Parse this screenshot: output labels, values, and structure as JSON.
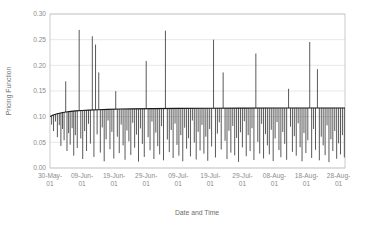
{
  "chart_data": {
    "type": "line",
    "title": "",
    "xlabel": "Date and Time",
    "ylabel": "Pricing Function",
    "ylim": [
      0.0,
      0.3
    ],
    "ytick_labels": [
      "0.00",
      "0.05",
      "0.10",
      "0.15",
      "0.20",
      "0.25",
      "0.30"
    ],
    "ytick_values": [
      0.0,
      0.05,
      0.1,
      0.15,
      0.2,
      0.25,
      0.3
    ],
    "xtick_labels": [
      "30-May-01",
      "09-Jun-01",
      "19-Jun-01",
      "29-Jun-01",
      "09-Jul-01",
      "19-Jul-01",
      "29-Jul-01",
      "08-Aug-01",
      "18-Aug-01",
      "28-Aug-01"
    ],
    "xtick_values": [
      0,
      10,
      20,
      30,
      40,
      50,
      60,
      70,
      80,
      90
    ],
    "xlim": [
      0,
      92
    ],
    "grid": true,
    "grid_axis": "y",
    "legend": false,
    "series_color": "#3b3b3b",
    "baseline_color": "#1a1a1a",
    "baseline_note": "Dense envelope curve rising from about 0.100 and flattening near 0.116",
    "baseline": [
      {
        "x": 0.0,
        "y": 0.1005
      },
      {
        "x": 1.0,
        "y": 0.1032
      },
      {
        "x": 2.0,
        "y": 0.1052
      },
      {
        "x": 3.0,
        "y": 0.1068
      },
      {
        "x": 4.0,
        "y": 0.1081
      },
      {
        "x": 5.0,
        "y": 0.1091
      },
      {
        "x": 6.5,
        "y": 0.1103
      },
      {
        "x": 8.0,
        "y": 0.1112
      },
      {
        "x": 10.0,
        "y": 0.1121
      },
      {
        "x": 12.0,
        "y": 0.1128
      },
      {
        "x": 15.0,
        "y": 0.1136
      },
      {
        "x": 18.0,
        "y": 0.1142
      },
      {
        "x": 22.0,
        "y": 0.1148
      },
      {
        "x": 26.0,
        "y": 0.1152
      },
      {
        "x": 32.0,
        "y": 0.1157
      },
      {
        "x": 40.0,
        "y": 0.1161
      },
      {
        "x": 50.0,
        "y": 0.1164
      },
      {
        "x": 60.0,
        "y": 0.1166
      },
      {
        "x": 70.0,
        "y": 0.1168
      },
      {
        "x": 80.0,
        "y": 0.1169
      },
      {
        "x": 92.0,
        "y": 0.117
      }
    ],
    "spikes": [
      {
        "x": 0.5,
        "top": 0.101,
        "bottom": 0.0845
      },
      {
        "x": 1.1,
        "top": 0.1035,
        "bottom": 0.072
      },
      {
        "x": 1.7,
        "top": 0.105,
        "bottom": 0.0905
      },
      {
        "x": 2.3,
        "top": 0.106,
        "bottom": 0.06
      },
      {
        "x": 2.9,
        "top": 0.107,
        "bottom": 0.0835
      },
      {
        "x": 3.4,
        "top": 0.1075,
        "bottom": 0.043
      },
      {
        "x": 3.9,
        "top": 0.108,
        "bottom": 0.076
      },
      {
        "x": 4.4,
        "top": 0.1085,
        "bottom": 0.054
      },
      {
        "x": 4.9,
        "top": 0.1688,
        "bottom": 0.109
      },
      {
        "x": 5.3,
        "top": 0.1092,
        "bottom": 0.033
      },
      {
        "x": 5.8,
        "top": 0.1097,
        "bottom": 0.068
      },
      {
        "x": 6.3,
        "top": 0.11,
        "bottom": 0.0455
      },
      {
        "x": 6.9,
        "top": 0.1104,
        "bottom": 0.0775
      },
      {
        "x": 7.4,
        "top": 0.1107,
        "bottom": 0.024
      },
      {
        "x": 7.9,
        "top": 0.111,
        "bottom": 0.064
      },
      {
        "x": 8.5,
        "top": 0.1113,
        "bottom": 0.039
      },
      {
        "x": 9.1,
        "top": 0.269,
        "bottom": 0.1115
      },
      {
        "x": 9.6,
        "top": 0.1117,
        "bottom": 0.0575
      },
      {
        "x": 10.2,
        "top": 0.112,
        "bottom": 0.0175
      },
      {
        "x": 10.8,
        "top": 0.1122,
        "bottom": 0.072
      },
      {
        "x": 11.4,
        "top": 0.1125,
        "bottom": 0.033
      },
      {
        "x": 12.0,
        "top": 0.1128,
        "bottom": 0.086
      },
      {
        "x": 12.6,
        "top": 0.113,
        "bottom": 0.0475
      },
      {
        "x": 13.2,
        "top": 0.2565,
        "bottom": 0.1131
      },
      {
        "x": 13.7,
        "top": 0.1133,
        "bottom": 0.0215
      },
      {
        "x": 14.2,
        "top": 0.2405,
        "bottom": 0.1134
      },
      {
        "x": 14.7,
        "top": 0.1136,
        "bottom": 0.0655
      },
      {
        "x": 15.2,
        "top": 0.1861,
        "bottom": 0.1137
      },
      {
        "x": 15.7,
        "top": 0.1138,
        "bottom": 0.03
      },
      {
        "x": 16.3,
        "top": 0.114,
        "bottom": 0.079
      },
      {
        "x": 16.9,
        "top": 0.1141,
        "bottom": 0.013
      },
      {
        "x": 17.5,
        "top": 0.1142,
        "bottom": 0.056
      },
      {
        "x": 18.1,
        "top": 0.1143,
        "bottom": 0.0925
      },
      {
        "x": 18.7,
        "top": 0.1144,
        "bottom": 0.0365
      },
      {
        "x": 19.3,
        "top": 0.1145,
        "bottom": 0.0705
      },
      {
        "x": 19.9,
        "top": 0.1147,
        "bottom": 0.0185
      },
      {
        "x": 20.5,
        "top": 0.1497,
        "bottom": 0.1148
      },
      {
        "x": 21.0,
        "top": 0.1148,
        "bottom": 0.061
      },
      {
        "x": 21.6,
        "top": 0.1149,
        "bottom": 0.029
      },
      {
        "x": 22.2,
        "top": 0.115,
        "bottom": 0.0845
      },
      {
        "x": 22.8,
        "top": 0.115,
        "bottom": 0.044
      },
      {
        "x": 23.4,
        "top": 0.1151,
        "bottom": 0.016
      },
      {
        "x": 24.0,
        "top": 0.1152,
        "bottom": 0.073
      },
      {
        "x": 24.6,
        "top": 0.1152,
        "bottom": 0.052
      },
      {
        "x": 25.2,
        "top": 0.1153,
        "bottom": 0.0255
      },
      {
        "x": 25.8,
        "top": 0.1153,
        "bottom": 0.088
      },
      {
        "x": 26.4,
        "top": 0.1154,
        "bottom": 0.0395
      },
      {
        "x": 27.0,
        "top": 0.1154,
        "bottom": 0.065
      },
      {
        "x": 27.6,
        "top": 0.1155,
        "bottom": 0.0125
      },
      {
        "x": 28.2,
        "top": 0.1155,
        "bottom": 0.077
      },
      {
        "x": 28.8,
        "top": 0.1156,
        "bottom": 0.047
      },
      {
        "x": 29.4,
        "top": 0.1156,
        "bottom": 0.0215
      },
      {
        "x": 30.0,
        "top": 0.2085,
        "bottom": 0.1157
      },
      {
        "x": 30.6,
        "top": 0.1157,
        "bottom": 0.06
      },
      {
        "x": 31.2,
        "top": 0.1157,
        "bottom": 0.0345
      },
      {
        "x": 31.8,
        "top": 0.1158,
        "bottom": 0.0905
      },
      {
        "x": 32.4,
        "top": 0.1158,
        "bottom": 0.0175
      },
      {
        "x": 33.0,
        "top": 0.1158,
        "bottom": 0.069
      },
      {
        "x": 33.6,
        "top": 0.1159,
        "bottom": 0.0425
      },
      {
        "x": 34.2,
        "top": 0.1159,
        "bottom": 0.0265
      },
      {
        "x": 34.8,
        "top": 0.1159,
        "bottom": 0.0815
      },
      {
        "x": 35.4,
        "top": 0.116,
        "bottom": 0.015
      },
      {
        "x": 36.0,
        "top": 0.2675,
        "bottom": 0.116
      },
      {
        "x": 36.6,
        "top": 0.116,
        "bottom": 0.0555
      },
      {
        "x": 37.2,
        "top": 0.1161,
        "bottom": 0.031
      },
      {
        "x": 37.8,
        "top": 0.1161,
        "bottom": 0.074
      },
      {
        "x": 38.4,
        "top": 0.1161,
        "bottom": 0.0195
      },
      {
        "x": 39.0,
        "top": 0.1162,
        "bottom": 0.0865
      },
      {
        "x": 39.6,
        "top": 0.1162,
        "bottom": 0.045
      },
      {
        "x": 40.2,
        "top": 0.1162,
        "bottom": 0.024
      },
      {
        "x": 40.8,
        "top": 0.1162,
        "bottom": 0.064
      },
      {
        "x": 41.4,
        "top": 0.1163,
        "bottom": 0.013
      },
      {
        "x": 42.0,
        "top": 0.1163,
        "bottom": 0.0785
      },
      {
        "x": 42.6,
        "top": 0.1163,
        "bottom": 0.0375
      },
      {
        "x": 43.2,
        "top": 0.1163,
        "bottom": 0.058
      },
      {
        "x": 43.8,
        "top": 0.1164,
        "bottom": 0.0225
      },
      {
        "x": 44.4,
        "top": 0.1164,
        "bottom": 0.0925
      },
      {
        "x": 45.0,
        "top": 0.1164,
        "bottom": 0.0495
      },
      {
        "x": 45.6,
        "top": 0.1164,
        "bottom": 0.0165
      },
      {
        "x": 46.2,
        "top": 0.1164,
        "bottom": 0.0705
      },
      {
        "x": 46.8,
        "top": 0.1165,
        "bottom": 0.034
      },
      {
        "x": 47.4,
        "top": 0.1165,
        "bottom": 0.084
      },
      {
        "x": 48.0,
        "top": 0.1165,
        "bottom": 0.028
      },
      {
        "x": 48.6,
        "top": 0.1165,
        "bottom": 0.061
      },
      {
        "x": 49.2,
        "top": 0.1165,
        "bottom": 0.014
      },
      {
        "x": 49.8,
        "top": 0.1166,
        "bottom": 0.076
      },
      {
        "x": 50.4,
        "top": 0.1166,
        "bottom": 0.042
      },
      {
        "x": 51.0,
        "top": 0.25,
        "bottom": 0.1166
      },
      {
        "x": 51.6,
        "top": 0.1166,
        "bottom": 0.0205
      },
      {
        "x": 52.2,
        "top": 0.1166,
        "bottom": 0.067
      },
      {
        "x": 52.8,
        "top": 0.1166,
        "bottom": 0.089
      },
      {
        "x": 53.4,
        "top": 0.1167,
        "bottom": 0.036
      },
      {
        "x": 54.0,
        "top": 0.1861,
        "bottom": 0.1167
      },
      {
        "x": 54.6,
        "top": 0.1167,
        "bottom": 0.053
      },
      {
        "x": 55.2,
        "top": 0.1167,
        "bottom": 0.0175
      },
      {
        "x": 55.8,
        "top": 0.1167,
        "bottom": 0.0725
      },
      {
        "x": 56.4,
        "top": 0.1167,
        "bottom": 0.03
      },
      {
        "x": 57.0,
        "top": 0.1167,
        "bottom": 0.082
      },
      {
        "x": 57.6,
        "top": 0.1168,
        "bottom": 0.0245
      },
      {
        "x": 58.2,
        "top": 0.1168,
        "bottom": 0.0585
      },
      {
        "x": 58.8,
        "top": 0.1168,
        "bottom": 0.012
      },
      {
        "x": 59.4,
        "top": 0.1168,
        "bottom": 0.0695
      },
      {
        "x": 60.0,
        "top": 0.1168,
        "bottom": 0.04
      },
      {
        "x": 60.6,
        "top": 0.1168,
        "bottom": 0.091
      },
      {
        "x": 61.2,
        "top": 0.1168,
        "bottom": 0.023
      },
      {
        "x": 61.8,
        "top": 0.1168,
        "bottom": 0.064
      },
      {
        "x": 62.4,
        "top": 0.1169,
        "bottom": 0.033
      },
      {
        "x": 63.0,
        "top": 0.1169,
        "bottom": 0.0775
      },
      {
        "x": 63.6,
        "top": 0.1169,
        "bottom": 0.0155
      },
      {
        "x": 64.2,
        "top": 0.223,
        "bottom": 0.1169
      },
      {
        "x": 64.8,
        "top": 0.1169,
        "bottom": 0.051
      },
      {
        "x": 65.4,
        "top": 0.1169,
        "bottom": 0.028
      },
      {
        "x": 66.0,
        "top": 0.1169,
        "bottom": 0.086
      },
      {
        "x": 66.6,
        "top": 0.1169,
        "bottom": 0.0185
      },
      {
        "x": 67.2,
        "top": 0.1169,
        "bottom": 0.066
      },
      {
        "x": 67.8,
        "top": 0.1169,
        "bottom": 0.044
      },
      {
        "x": 68.4,
        "top": 0.1169,
        "bottom": 0.0265
      },
      {
        "x": 69.0,
        "top": 0.1169,
        "bottom": 0.0745
      },
      {
        "x": 69.6,
        "top": 0.1169,
        "bottom": 0.0135
      },
      {
        "x": 70.2,
        "top": 0.1169,
        "bottom": 0.0575
      },
      {
        "x": 70.8,
        "top": 0.1169,
        "bottom": 0.0895
      },
      {
        "x": 71.4,
        "top": 0.1169,
        "bottom": 0.035
      },
      {
        "x": 72.0,
        "top": 0.1169,
        "bottom": 0.021
      },
      {
        "x": 72.6,
        "top": 0.1169,
        "bottom": 0.07
      },
      {
        "x": 73.2,
        "top": 0.1169,
        "bottom": 0.047
      },
      {
        "x": 73.8,
        "top": 0.1169,
        "bottom": 0.016
      },
      {
        "x": 74.4,
        "top": 0.1543,
        "bottom": 0.1169
      },
      {
        "x": 75.0,
        "top": 0.1169,
        "bottom": 0.0805
      },
      {
        "x": 75.6,
        "top": 0.117,
        "bottom": 0.0315
      },
      {
        "x": 76.2,
        "top": 0.117,
        "bottom": 0.062
      },
      {
        "x": 76.8,
        "top": 0.117,
        "bottom": 0.024
      },
      {
        "x": 77.4,
        "top": 0.117,
        "bottom": 0.087
      },
      {
        "x": 78.0,
        "top": 0.117,
        "bottom": 0.0405
      },
      {
        "x": 78.6,
        "top": 0.117,
        "bottom": 0.013
      },
      {
        "x": 79.2,
        "top": 0.117,
        "bottom": 0.068
      },
      {
        "x": 79.8,
        "top": 0.117,
        "bottom": 0.029
      },
      {
        "x": 80.4,
        "top": 0.117,
        "bottom": 0.054
      },
      {
        "x": 81.0,
        "top": 0.2455,
        "bottom": 0.117
      },
      {
        "x": 81.6,
        "top": 0.117,
        "bottom": 0.0195
      },
      {
        "x": 82.2,
        "top": 0.117,
        "bottom": 0.076
      },
      {
        "x": 82.8,
        "top": 0.117,
        "bottom": 0.0355
      },
      {
        "x": 83.4,
        "top": 0.1925,
        "bottom": 0.117
      },
      {
        "x": 84.0,
        "top": 0.117,
        "bottom": 0.015
      },
      {
        "x": 84.6,
        "top": 0.117,
        "bottom": 0.061
      },
      {
        "x": 85.2,
        "top": 0.117,
        "bottom": 0.044
      },
      {
        "x": 85.8,
        "top": 0.117,
        "bottom": 0.025
      },
      {
        "x": 86.4,
        "top": 0.117,
        "bottom": 0.083
      },
      {
        "x": 87.0,
        "top": 0.117,
        "bottom": 0.0115
      },
      {
        "x": 87.6,
        "top": 0.117,
        "bottom": 0.056
      },
      {
        "x": 88.2,
        "top": 0.117,
        "bottom": 0.033
      },
      {
        "x": 88.8,
        "top": 0.117,
        "bottom": 0.072
      },
      {
        "x": 89.4,
        "top": 0.117,
        "bottom": 0.018
      },
      {
        "x": 90.0,
        "top": 0.117,
        "bottom": 0.048
      },
      {
        "x": 90.6,
        "top": 0.117,
        "bottom": 0.0265
      },
      {
        "x": 91.2,
        "top": 0.117,
        "bottom": 0.064
      },
      {
        "x": 91.8,
        "top": 0.117,
        "bottom": 0.0205
      }
    ]
  },
  "style": {
    "plot_background": "#ffffff",
    "grid_color": "#d9d9d9",
    "frame_color": "#bfbfbf",
    "tick_text_color": "#8c8c8c",
    "axis_title_color": "#6e6e6e"
  }
}
